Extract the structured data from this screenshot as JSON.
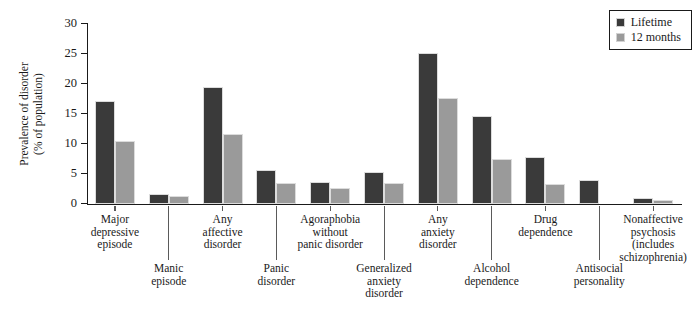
{
  "chart_data": {
    "type": "bar",
    "title": "",
    "xlabel": "",
    "ylabel_line1": "Prevalence of disorder",
    "ylabel_line2": "(% of population)",
    "ylim": [
      0,
      30
    ],
    "yticks": [
      0,
      5,
      10,
      15,
      20,
      25,
      30
    ],
    "ytick_labels": [
      "0",
      "5",
      "10",
      "15",
      "20",
      "25",
      "30"
    ],
    "grid": false,
    "legend_position": "top-right",
    "categories": [
      "Major depressive episode",
      "Manic episode",
      "Any affective disorder",
      "Panic disorder",
      "Agoraphobia without panic disorder",
      "Generalized anxiety disorder",
      "Any anxiety disorder",
      "Alcohol dependence",
      "Drug dependence",
      "Antisocial personality",
      "Nonaffective psychosis (includes schizophrenia)"
    ],
    "category_lines": [
      [
        "Major",
        "depressive",
        "episode"
      ],
      [
        "Manic",
        "episode"
      ],
      [
        "Any",
        "affective",
        "disorder"
      ],
      [
        "Panic",
        "disorder"
      ],
      [
        "Agoraphobia",
        "without",
        "panic disorder"
      ],
      [
        "Generalized",
        "anxiety",
        "disorder"
      ],
      [
        "Any",
        "anxiety",
        "disorder"
      ],
      [
        "Alcohol",
        "dependence"
      ],
      [
        "Drug",
        "dependence"
      ],
      [
        "Antisocial",
        "personality"
      ],
      [
        "Nonaffective",
        "psychosis",
        "(includes",
        "schizophrenia)"
      ]
    ],
    "category_label_row": [
      "top",
      "bottom",
      "top",
      "bottom",
      "top",
      "bottom",
      "top",
      "bottom",
      "top",
      "bottom",
      "top"
    ],
    "series": [
      {
        "name": "Lifetime",
        "color": "#3a3a3a",
        "values": [
          17.2,
          1.7,
          19.5,
          5.6,
          3.7,
          5.3,
          25.2,
          14.7,
          7.9,
          4.0,
          1.0
        ]
      },
      {
        "name": "12 months",
        "color": "#9a9a9a",
        "values": [
          10.5,
          1.3,
          11.6,
          3.5,
          2.6,
          3.5,
          17.7,
          7.5,
          3.3,
          0.0,
          0.7
        ]
      }
    ]
  },
  "legend": {
    "entries": [
      {
        "label": "Lifetime",
        "color": "#3a3a3a"
      },
      {
        "label": "12 months",
        "color": "#9a9a9a"
      }
    ]
  }
}
